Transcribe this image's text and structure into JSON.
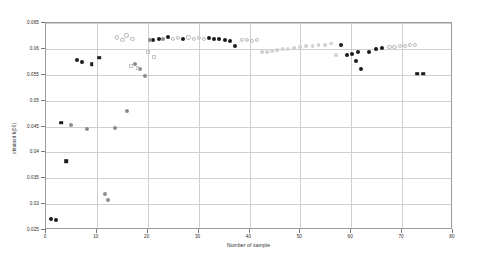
{
  "chart_data": {
    "type": "scatter",
    "title": "",
    "xlabel": "Number of sample",
    "ylabel": "obtained h(00)",
    "xlim": [
      0,
      80
    ],
    "ylim": [
      0.025,
      0.065
    ],
    "xticks": [
      0,
      10,
      20,
      30,
      40,
      50,
      60,
      70,
      80
    ],
    "yticks": [
      0.025,
      0.03,
      0.035,
      0.04,
      0.045,
      0.05,
      0.055,
      0.06,
      0.065
    ],
    "xticklabels": [
      "0",
      "10",
      "20",
      "30",
      "40",
      "50",
      "60",
      "70",
      "80"
    ],
    "yticklabels": [
      "0.025",
      "0.03",
      "0.035",
      "0.04",
      "0.045",
      "0.05",
      "0.055",
      "0.06",
      "0.065"
    ],
    "grid": true,
    "legend": "none",
    "series": [
      {
        "name": "dark-filled-circle",
        "marker": "filled-circle",
        "color": "#1b1b1b",
        "size": 4.0,
        "points": [
          {
            "x": 1.0,
            "y": 0.0272
          },
          {
            "x": 2.0,
            "y": 0.027
          },
          {
            "x": 6.0,
            "y": 0.0578
          },
          {
            "x": 7.0,
            "y": 0.0575
          },
          {
            "x": 21.0,
            "y": 0.0618
          },
          {
            "x": 22.2,
            "y": 0.062
          },
          {
            "x": 24.0,
            "y": 0.0622
          },
          {
            "x": 27.0,
            "y": 0.062
          },
          {
            "x": 32.0,
            "y": 0.0621
          },
          {
            "x": 33.0,
            "y": 0.062
          },
          {
            "x": 34.0,
            "y": 0.0619
          },
          {
            "x": 35.2,
            "y": 0.0617
          },
          {
            "x": 36.2,
            "y": 0.0615
          },
          {
            "x": 37.2,
            "y": 0.0605
          },
          {
            "x": 58.0,
            "y": 0.0608
          },
          {
            "x": 59.2,
            "y": 0.0588
          },
          {
            "x": 60.2,
            "y": 0.059
          },
          {
            "x": 61.4,
            "y": 0.0594
          },
          {
            "x": 61.0,
            "y": 0.0576
          },
          {
            "x": 62.0,
            "y": 0.0562
          },
          {
            "x": 63.5,
            "y": 0.0594
          },
          {
            "x": 64.8,
            "y": 0.06
          },
          {
            "x": 66.0,
            "y": 0.0602
          }
        ]
      },
      {
        "name": "dark-filled-square",
        "marker": "filled-square",
        "color": "#1b1b1b",
        "size": 3.6,
        "points": [
          {
            "x": 3.0,
            "y": 0.0457
          },
          {
            "x": 4.0,
            "y": 0.0383
          },
          {
            "x": 9.0,
            "y": 0.057
          },
          {
            "x": 10.5,
            "y": 0.0583
          },
          {
            "x": 73.0,
            "y": 0.0552
          },
          {
            "x": 74.2,
            "y": 0.0552
          }
        ]
      },
      {
        "name": "medium-gray-filled-circle",
        "marker": "filled-circle",
        "color": "#8c8c8c",
        "size": 4.0,
        "points": [
          {
            "x": 5.0,
            "y": 0.0452
          },
          {
            "x": 8.0,
            "y": 0.0446
          },
          {
            "x": 11.5,
            "y": 0.032
          },
          {
            "x": 12.2,
            "y": 0.0308
          },
          {
            "x": 13.5,
            "y": 0.0448
          },
          {
            "x": 16.0,
            "y": 0.048
          },
          {
            "x": 17.5,
            "y": 0.0571
          },
          {
            "x": 18.5,
            "y": 0.0562
          },
          {
            "x": 19.5,
            "y": 0.0548
          },
          {
            "x": 20.5,
            "y": 0.0618
          },
          {
            "x": 23.0,
            "y": 0.062
          }
        ]
      },
      {
        "name": "light-gray-open-circle",
        "marker": "open-circle",
        "color": "#b8b8b8",
        "size": 4.2,
        "points": [
          {
            "x": 14.0,
            "y": 0.0622
          },
          {
            "x": 15.0,
            "y": 0.0618
          },
          {
            "x": 15.8,
            "y": 0.0626
          },
          {
            "x": 17.0,
            "y": 0.0619
          },
          {
            "x": 25.0,
            "y": 0.062
          },
          {
            "x": 26.0,
            "y": 0.0621
          },
          {
            "x": 28.0,
            "y": 0.0622
          },
          {
            "x": 29.0,
            "y": 0.062
          },
          {
            "x": 30.0,
            "y": 0.0621
          },
          {
            "x": 31.0,
            "y": 0.0619
          },
          {
            "x": 38.5,
            "y": 0.0618
          },
          {
            "x": 39.5,
            "y": 0.0617
          },
          {
            "x": 40.5,
            "y": 0.0616
          },
          {
            "x": 41.5,
            "y": 0.0618
          },
          {
            "x": 67.5,
            "y": 0.0604
          },
          {
            "x": 68.5,
            "y": 0.0604
          },
          {
            "x": 69.5,
            "y": 0.0606
          },
          {
            "x": 70.5,
            "y": 0.0605
          },
          {
            "x": 71.5,
            "y": 0.0607
          },
          {
            "x": 72.5,
            "y": 0.0608
          }
        ]
      },
      {
        "name": "light-gray-open-square",
        "marker": "open-square",
        "color": "#c4c4c4",
        "size": 3.8,
        "points": [
          {
            "x": 20.0,
            "y": 0.0593
          },
          {
            "x": 21.2,
            "y": 0.0584
          },
          {
            "x": 16.8,
            "y": 0.0566
          },
          {
            "x": 18.0,
            "y": 0.0563
          }
        ]
      },
      {
        "name": "very-light-gray-filled-circle",
        "marker": "filled-circle",
        "color": "#d2d2d2",
        "size": 3.8,
        "points": [
          {
            "x": 42.5,
            "y": 0.0593
          },
          {
            "x": 43.5,
            "y": 0.0594
          },
          {
            "x": 44.5,
            "y": 0.0596
          },
          {
            "x": 45.5,
            "y": 0.0597
          },
          {
            "x": 46.5,
            "y": 0.0599
          },
          {
            "x": 47.5,
            "y": 0.06
          },
          {
            "x": 48.8,
            "y": 0.0602
          },
          {
            "x": 50.0,
            "y": 0.0603
          },
          {
            "x": 51.2,
            "y": 0.0605
          },
          {
            "x": 52.4,
            "y": 0.0606
          },
          {
            "x": 53.6,
            "y": 0.0608
          },
          {
            "x": 54.8,
            "y": 0.0608
          },
          {
            "x": 56.0,
            "y": 0.061
          },
          {
            "x": 57.0,
            "y": 0.0588
          }
        ]
      }
    ]
  }
}
